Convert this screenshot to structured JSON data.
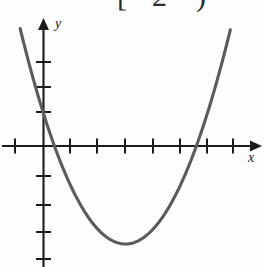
{
  "figure": {
    "title_fragment": {
      "bracket": "[",
      "number": "2",
      "paren": ")",
      "note": "bottom edges of cropped text at top of image"
    },
    "axis_labels": {
      "x": "x",
      "y": "y"
    },
    "colors": {
      "curve": "#5b5b5b",
      "axis": "#1b1b1b",
      "background": "#fdfdfd",
      "text": "#2b2b2b"
    }
  },
  "chart_data": {
    "type": "line",
    "title": "",
    "subtitle": "",
    "xlabel": "x",
    "ylabel": "y",
    "grid": false,
    "legend": null,
    "curve_kind": "parabola",
    "orientation": "opens-upward",
    "xlim": [
      -1.1,
      8.0
    ],
    "ylim": [
      -5.3,
      4.6
    ],
    "x_ticks": [
      -1,
      0,
      1,
      2,
      3,
      4,
      5,
      6,
      7
    ],
    "y_ticks": [
      -4,
      -3,
      -2,
      -1,
      0,
      1,
      2,
      3
    ],
    "x_tick_pixels": [
      15,
      44,
      70,
      97,
      125,
      153,
      180,
      207,
      233
    ],
    "y_tick_pixels": [
      259,
      232,
      205,
      176,
      146,
      112,
      87,
      62
    ],
    "origin_pixel": [
      43.5,
      146
    ],
    "unit_pixels": {
      "x": 27.3,
      "y": 28.0
    },
    "vertex": [
      3.0,
      -3.5
    ],
    "roots": [
      0.4,
      5.6
    ],
    "y_intercept": 1.2,
    "equation": "y = 0.39(x - 3)^2 - 3.5",
    "points": [
      [
        -0.97,
        2.7
      ],
      [
        -0.8,
        2.0
      ],
      [
        -0.6,
        1.5
      ],
      [
        -0.4,
        1.0
      ],
      [
        -0.2,
        0.6
      ],
      [
        0.0,
        1.2
      ],
      [
        0.4,
        0.0
      ],
      [
        1.0,
        -2.0
      ],
      [
        1.5,
        -2.6
      ],
      [
        2.0,
        -3.1
      ],
      [
        2.5,
        -3.4
      ],
      [
        3.0,
        -3.5
      ],
      [
        3.5,
        -3.4
      ],
      [
        4.0,
        -3.1
      ],
      [
        4.5,
        -2.6
      ],
      [
        5.0,
        -2.0
      ],
      [
        5.6,
        0.0
      ],
      [
        6.0,
        0.9
      ],
      [
        6.5,
        1.9
      ],
      [
        7.0,
        3.0
      ],
      [
        7.4,
        4.3
      ]
    ]
  }
}
